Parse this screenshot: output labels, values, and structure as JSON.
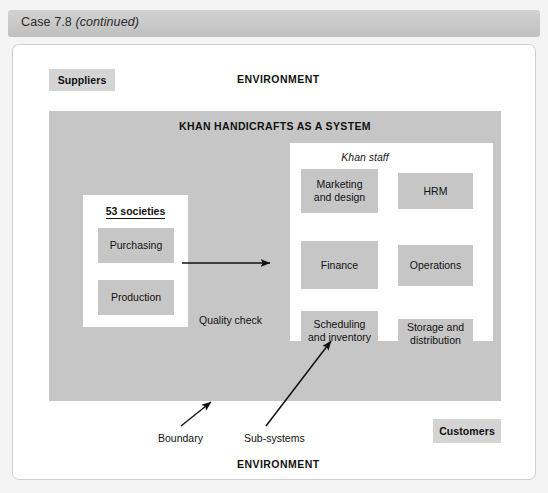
{
  "header": {
    "prefix": "Case 7.8 ",
    "italic": "(continued)"
  },
  "figure": {
    "environment_top": "ENVIRONMENT",
    "environment_bottom": "ENVIRONMENT",
    "suppliers": "Suppliers",
    "customers": "Customers",
    "system_title": "KHAN HANDICRAFTS AS A SYSTEM",
    "societies_title": "53 societies",
    "staff_caption": "Khan staff",
    "societies_boxes": [
      {
        "label": "Purchasing"
      },
      {
        "label": "Production"
      }
    ],
    "staff_boxes": [
      {
        "label": "Marketing\nand design"
      },
      {
        "label": "HRM"
      },
      {
        "label": "Finance"
      },
      {
        "label": "Operations"
      },
      {
        "label": "Scheduling\nand inventory"
      },
      {
        "label": "Storage and\ndistribution"
      }
    ],
    "flow_label": "Quality check",
    "annotations": [
      {
        "label": "Boundary"
      },
      {
        "label": "Sub-systems"
      }
    ]
  },
  "colors": {
    "header_bar": "#c9c9c9",
    "box_fill": "#c6c6c6",
    "tag_fill": "#d4d4d4",
    "panel_fill": "#ffffff",
    "page_bg": "#f4f4f4",
    "text": "#111111"
  }
}
